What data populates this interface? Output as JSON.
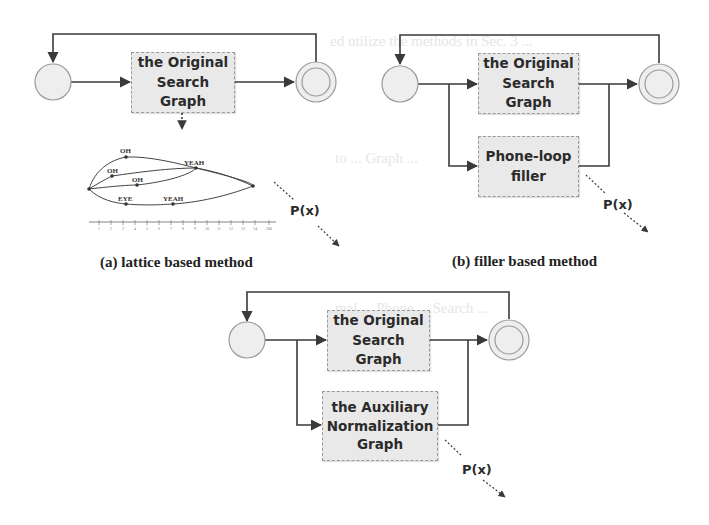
{
  "figure": {
    "background_color": "#ffffff",
    "line_color": "#3a3a3a",
    "box_fill": "#e9e9e9",
    "box_border": "#9a9a9a",
    "node_fill": "#eeeeee"
  },
  "bleed_through_text": [
    "ed  utilize  the  methods  in  Sec.  3  ...",
    "to  ...  Graph  ...",
    "mal  ...  Phone  ...  Search  ...",
    "..."
  ],
  "panels": {
    "a": {
      "caption": "(a) lattice based method",
      "search_graph_label_line1": "the Original",
      "search_graph_label_line2": "Search Graph",
      "output_label": "P(x)",
      "lattice": {
        "words": [
          "OH",
          "OH",
          "OH",
          "YEAH",
          "EYE",
          "YEAH"
        ],
        "timeline_ticks": [
          "1",
          "2",
          "3",
          "4",
          "5",
          "6",
          "7",
          "8",
          "9",
          "10",
          "11",
          "12",
          "13",
          "14",
          "100"
        ]
      }
    },
    "b": {
      "caption": "(b) filler based method",
      "search_graph_label_line1": "the Original",
      "search_graph_label_line2": "Search Graph",
      "filler_label_line1": "Phone-loop",
      "filler_label_line2": "filler",
      "output_label": "P(x)"
    },
    "c": {
      "search_graph_label_line1": "the Original",
      "search_graph_label_line2": "Search Graph",
      "aux_label_line1": "the Auxiliary",
      "aux_label_line2": "Normalization",
      "aux_label_line3": "Graph",
      "output_label": "P(x)"
    }
  }
}
